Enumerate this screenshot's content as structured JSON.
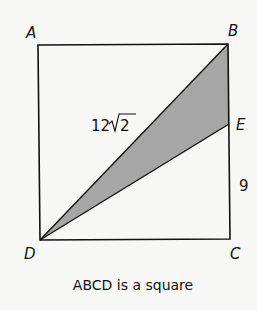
{
  "diagram": {
    "vertices": {
      "A": "A",
      "B": "B",
      "C": "C",
      "D": "D",
      "E": "E"
    },
    "diagonal_label": "12",
    "diagonal_radicand": "2",
    "side_label": "9",
    "caption": "ABCD is a square",
    "colors": {
      "stroke": "#111111",
      "shade": "#a6a6a6",
      "background": "#f7f7f5"
    }
  }
}
